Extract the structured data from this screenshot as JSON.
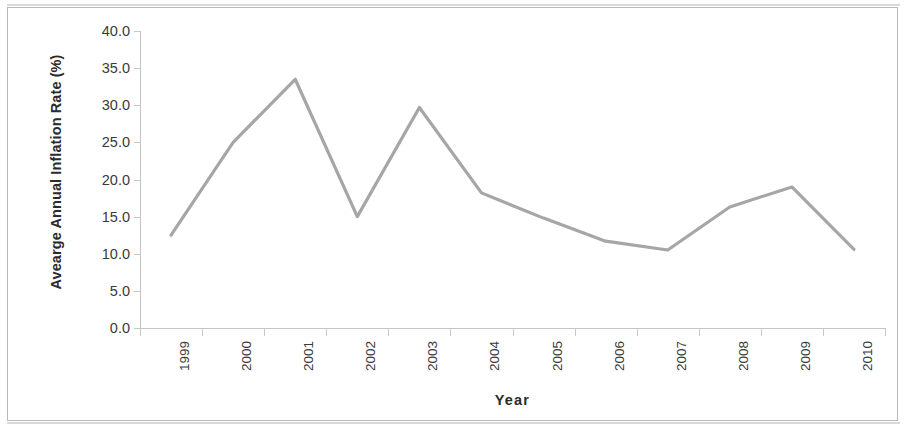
{
  "chart_data": {
    "type": "line",
    "title": "",
    "subtitle": "",
    "xlabel": "Year",
    "ylabel": "Avearge Annual Inflation Rate (%)",
    "categories": [
      "1999",
      "2000",
      "2001",
      "2002",
      "2003",
      "2004",
      "2005",
      "2006",
      "2007",
      "2008",
      "2009",
      "2010"
    ],
    "series": [
      {
        "name": "Average Annual Inflation Rate",
        "color": "#a6a6a6",
        "values": [
          12.5,
          25.0,
          33.5,
          15.0,
          29.7,
          18.2,
          14.8,
          11.7,
          10.5,
          16.3,
          19.0,
          10.6
        ]
      }
    ],
    "ylim": [
      0.0,
      40.0
    ],
    "y_tick_step": 5.0,
    "y_tick_labels": [
      "0.0",
      "5.0",
      "10.0",
      "15.0",
      "20.0",
      "25.0",
      "30.0",
      "35.0",
      "40.0"
    ],
    "y_tick_values": [
      0.0,
      5.0,
      10.0,
      15.0,
      20.0,
      25.0,
      30.0,
      35.0,
      40.0
    ],
    "grid": false,
    "legend": false,
    "legend_position": "none",
    "axis_color": "#c4c4c4",
    "text_color": "#3a3a3a",
    "background": "#ffffff"
  },
  "figure": {
    "border_color": "#b9b9b9",
    "width": 905,
    "height": 429
  }
}
